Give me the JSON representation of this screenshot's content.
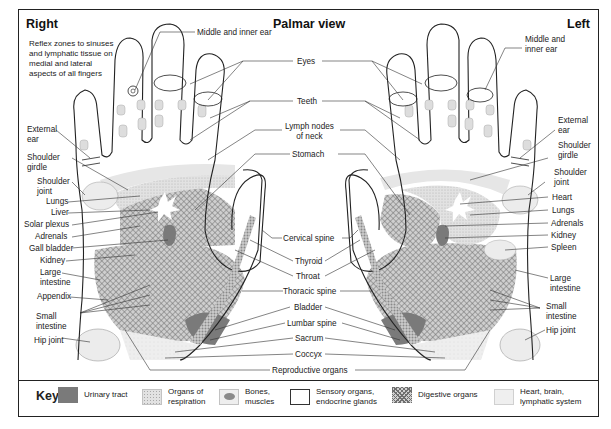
{
  "titles": {
    "right": "Right",
    "center": "Palmar view",
    "left": "Left"
  },
  "note": [
    "Reflex zones to sinuses",
    "and lymphatic tissue on",
    "medial and lateral",
    "aspects of all fingers"
  ],
  "labels_right_hand": {
    "middle_inner_ear": "Middle and inner ear",
    "external_ear": [
      "External",
      "ear"
    ],
    "shoulder_girdle": [
      "Shoulder",
      "girdle"
    ],
    "shoulder_joint": [
      "Shoulder",
      "joint"
    ],
    "lungs": "Lungs",
    "liver": "Liver",
    "solar_plexus": "Solar plexus",
    "adrenals": "Adrenals",
    "gall_bladder": "Gall bladder",
    "kidney": "Kidney",
    "large_intestine": [
      "Large",
      "intestine"
    ],
    "appendix": "Appendix",
    "small_intestine": [
      "Small",
      "intestine"
    ],
    "hip_joint": "Hip joint"
  },
  "labels_center": {
    "eyes": "Eyes",
    "teeth": "Teeth",
    "lymph_nodes": [
      "Lymph nodes",
      "of neck"
    ],
    "stomach": "Stomach",
    "cervical_spine": "Cervical spine",
    "thyroid": "Thyroid",
    "throat": "Throat",
    "thoracic_spine": "Thoracic spine",
    "bladder": "Bladder",
    "lumbar_spine": "Lumbar spine",
    "sacrum": "Sacrum",
    "coccyx": "Coccyx",
    "reproductive_organs": "Reproductive organs"
  },
  "labels_left_hand": {
    "middle_inner_ear": [
      "Middle and",
      "inner ear"
    ],
    "external_ear": [
      "External",
      "ear"
    ],
    "shoulder_girdle": [
      "Shoulder",
      "girdle"
    ],
    "shoulder_joint": [
      "Shoulder",
      "joint"
    ],
    "heart": "Heart",
    "lungs": "Lungs",
    "adrenals": "Adrenals",
    "kidney": "Kidney",
    "spleen": "Spleen",
    "large_intestine": [
      "Large",
      "intestine"
    ],
    "small_intestine": [
      "Small",
      "intestine"
    ],
    "hip_joint": "Hip joint"
  },
  "key": {
    "title": "Key",
    "items": [
      {
        "label": [
          "Urinary tract"
        ],
        "pattern": "urinary",
        "color": "#7a7a7a"
      },
      {
        "label": [
          "Organs of",
          "respiration"
        ],
        "pattern": "respiration",
        "color": "#d9d9d9"
      },
      {
        "label": [
          "Bones,",
          "muscles"
        ],
        "pattern": "bones",
        "color": "#bdbdbd"
      },
      {
        "label": [
          "Sensory organs,",
          "endocrine glands"
        ],
        "pattern": "sensory",
        "color": "#ffffff"
      },
      {
        "label": [
          "Digestive organs"
        ],
        "pattern": "digestive",
        "color": "#8c8c8c"
      },
      {
        "label": [
          "Heart, brain,",
          "lymphatic system"
        ],
        "pattern": "heart",
        "color": "#ececec"
      }
    ]
  }
}
